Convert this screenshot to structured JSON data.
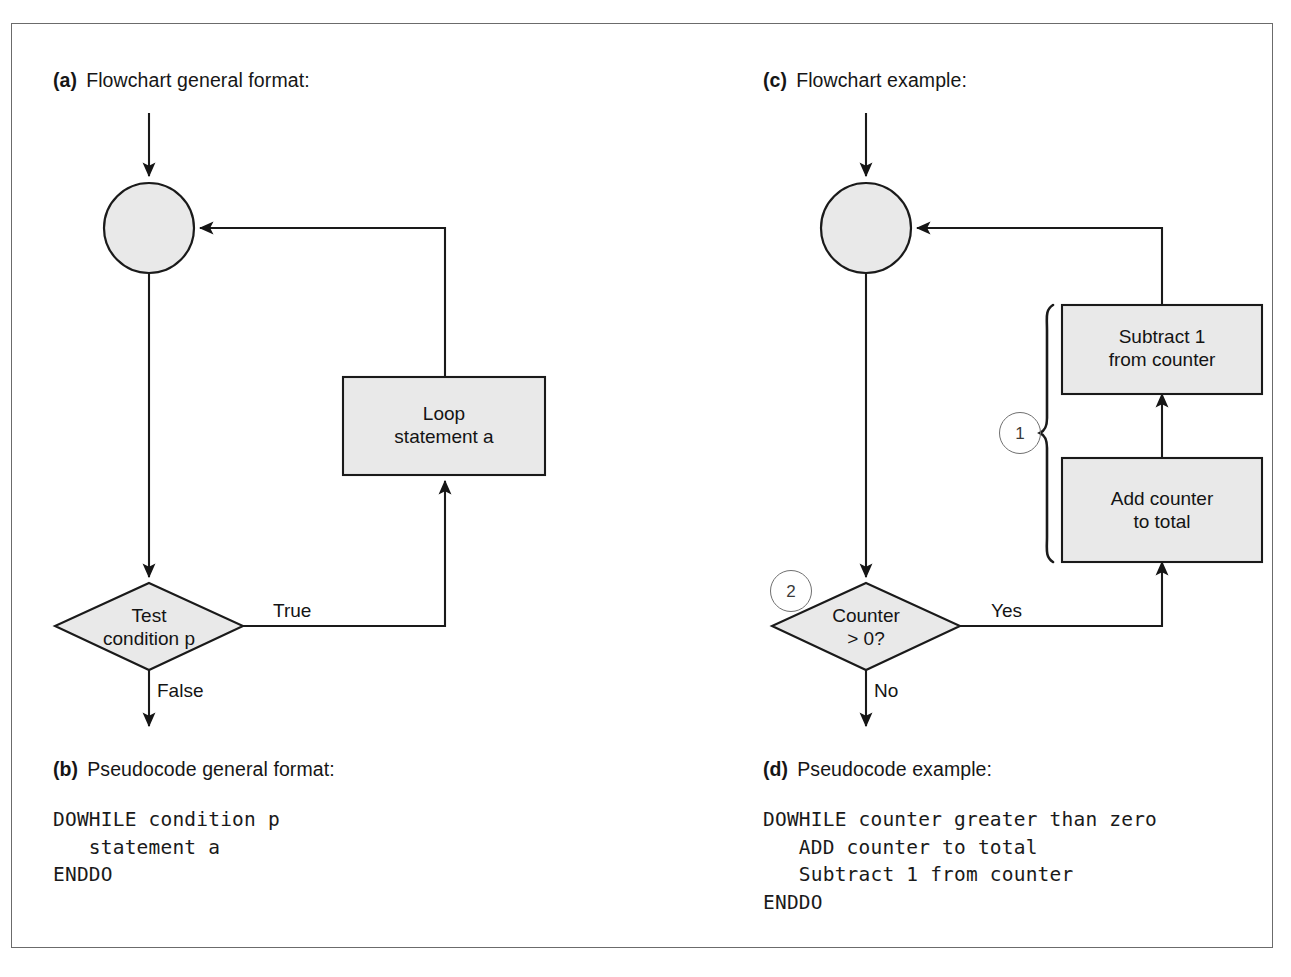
{
  "figure": {
    "background": "#ffffff",
    "frame_color": "#6b6b6b",
    "shape_fill": "#e9e9e9",
    "shape_stroke": "#1a1a1a"
  },
  "panels": {
    "a": {
      "tag": "(a)",
      "caption": "Flowchart general format:",
      "nodes": {
        "loop_box": "Loop\nstatement a",
        "decision": "Test\ncondition p"
      },
      "edge_labels": {
        "true": "True",
        "false": "False"
      }
    },
    "b": {
      "tag": "(b)",
      "caption": "Pseudocode general format:",
      "code": "DOWHILE condition p\n   statement a\nENDDO"
    },
    "c": {
      "tag": "(c)",
      "caption": "Flowchart example:",
      "nodes": {
        "subtract_box": "Subtract 1\nfrom counter",
        "add_box": "Add counter\nto total",
        "decision": "Counter\n> 0?"
      },
      "edge_labels": {
        "yes": "Yes",
        "no": "No"
      },
      "markers": {
        "one": "1",
        "two": "2"
      }
    },
    "d": {
      "tag": "(d)",
      "caption": "Pseudocode example:",
      "code": "DOWHILE counter greater than zero\n   ADD counter to total\n   Subtract 1 from counter\nENDDO"
    }
  }
}
